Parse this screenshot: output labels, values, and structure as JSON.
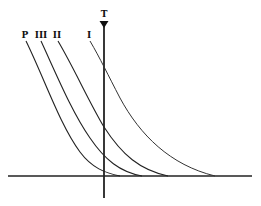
{
  "diagram": {
    "type": "curve-family",
    "axis_top_label": "T",
    "curve_labels": [
      "P",
      "III",
      "II",
      "I"
    ],
    "colors": {
      "stroke": "#222222",
      "background": "#ffffff"
    }
  }
}
